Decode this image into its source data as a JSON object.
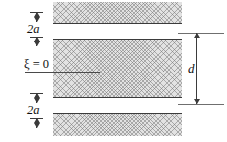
{
  "figure": {
    "labels": {
      "gap_top": "2a",
      "gap_bottom": "2a",
      "centerline": "ξ = 0",
      "channel_width": "d"
    },
    "colors": {
      "hatch_fill": "#e2e2e2",
      "hatch_stroke": "#787878",
      "boundary_line": "#3b3b3b",
      "extension_line": "#6f6f6f",
      "text": "#101010",
      "background": "#ffffff"
    },
    "geometry": {
      "band_left_px": 53,
      "band_right_px": 182,
      "top_band": {
        "y": 2,
        "height": 22
      },
      "upper_plate": {
        "y": 40,
        "height": 31
      },
      "lower_plate": {
        "y": 72,
        "height": 26
      },
      "bottom_band": {
        "y": 114,
        "height": 22
      },
      "centerline_y": 72,
      "dimension_d_x": 196,
      "dimension_2a_x": 36
    }
  }
}
